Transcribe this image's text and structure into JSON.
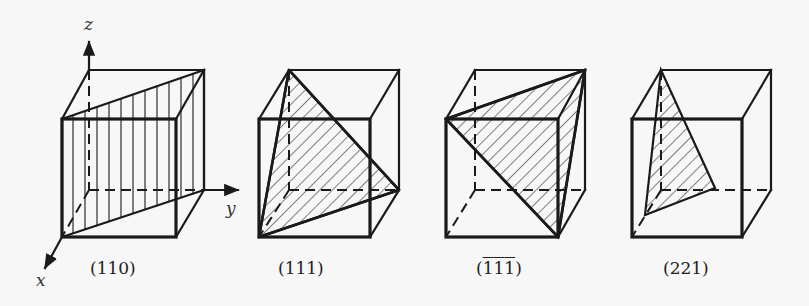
{
  "figure": {
    "axes": {
      "x_label": "x",
      "y_label": "y",
      "z_label": "z"
    },
    "cubes": [
      {
        "id": "cube-110",
        "label": "(110)",
        "plane": "(110)",
        "hatch": "vertical"
      },
      {
        "id": "cube-111",
        "label": "(111)",
        "plane": "(111)",
        "hatch": "diagonal"
      },
      {
        "id": "cube-neg111",
        "label_parts": [
          "(",
          "1",
          "1",
          "1",
          ")"
        ],
        "plane": "(-1-1-1)",
        "overbar": true,
        "hatch": "diagonal"
      },
      {
        "id": "cube-221",
        "label": "(221)",
        "plane": "(221)",
        "hatch": "diagonal"
      }
    ]
  },
  "colors": {
    "background": "#f7f7f7",
    "ink": "#1a1a1a"
  }
}
